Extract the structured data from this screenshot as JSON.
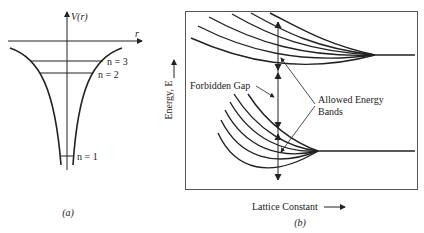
{
  "panel_a": {
    "axis_v_label": "V(r)",
    "axis_r_label": "r",
    "levels": [
      {
        "label": "n = 3"
      },
      {
        "label": "n = 2"
      },
      {
        "label": "n = 1"
      }
    ],
    "caption": "(a)"
  },
  "panel_b": {
    "y_axis_label": "Energy, E",
    "x_axis_label": "Lattice Constant",
    "annotations": {
      "forbidden_gap": "Forbidden Gap",
      "allowed_line1": "Allowed Energy",
      "allowed_line2": "Bands"
    },
    "caption": "(b)"
  },
  "colors": {
    "line": "#222222",
    "background": "#ffffff"
  }
}
